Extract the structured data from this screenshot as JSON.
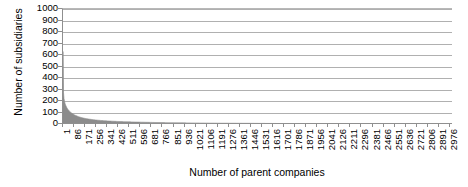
{
  "chart_data": {
    "type": "area",
    "title": "",
    "xlabel": "Number of parent companies",
    "ylabel": "Number of subsidiaries",
    "grid": true,
    "legend": false,
    "legend_position": "none",
    "xlim": [
      1,
      3000
    ],
    "ylim": [
      0,
      1000
    ],
    "y_ticks": [
      0,
      100,
      200,
      300,
      400,
      500,
      600,
      700,
      800,
      900,
      1000
    ],
    "y_tick_labels": [
      "0",
      "100",
      "200",
      "300",
      "400",
      "500",
      "600",
      "700",
      "800",
      "900",
      "1000"
    ],
    "x_tick_step": 85,
    "x_ticks": [
      1,
      86,
      171,
      256,
      341,
      426,
      511,
      596,
      681,
      766,
      851,
      936,
      1021,
      1106,
      1191,
      1276,
      1361,
      1446,
      1531,
      1616,
      1701,
      1786,
      1871,
      1956,
      2041,
      2126,
      2211,
      2296,
      2381,
      2466,
      2551,
      2636,
      2721,
      2806,
      2891,
      2976
    ],
    "x_tick_labels": [
      "1",
      "86",
      "171",
      "256",
      "341",
      "426",
      "511",
      "596",
      "681",
      "766",
      "851",
      "936",
      "1021",
      "1106",
      "1191",
      "1276",
      "1361",
      "1446",
      "1531",
      "1616",
      "1701",
      "1786",
      "1871",
      "1956",
      "2041",
      "2126",
      "2211",
      "2296",
      "2381",
      "2466",
      "2551",
      "2636",
      "2721",
      "2806",
      "2891",
      "2976"
    ],
    "series_name": "Subsidiaries per parent company (rank ordered)",
    "series_color": "#8c8c8c",
    "x": [
      1,
      2,
      3,
      4,
      5,
      6,
      8,
      10,
      12,
      15,
      18,
      22,
      26,
      31,
      37,
      44,
      52,
      62,
      74,
      88,
      105,
      125,
      150,
      178,
      212,
      252,
      300,
      357,
      425,
      505,
      600,
      714,
      849,
      1010,
      1201,
      1428,
      1698,
      2019,
      2400,
      2700,
      2976
    ],
    "values": [
      630,
      420,
      330,
      295,
      270,
      252,
      228,
      212,
      200,
      186,
      174,
      162,
      152,
      141,
      130,
      120,
      110,
      100,
      90,
      80,
      71,
      62,
      54,
      47,
      41,
      35,
      30,
      26,
      22,
      19,
      16,
      13,
      11,
      9,
      7,
      6,
      4,
      3,
      2,
      1,
      1
    ]
  }
}
